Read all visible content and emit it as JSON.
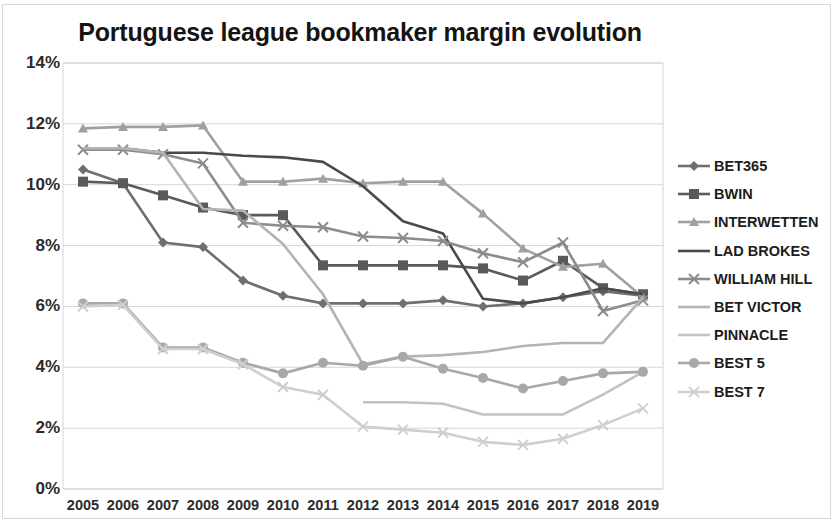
{
  "chart_title": "Portuguese league bookmaker margin evolution",
  "axes": {
    "y_ticks": [
      "0%",
      "2%",
      "4%",
      "6%",
      "8%",
      "10%",
      "12%",
      "14%"
    ],
    "x_ticks": [
      "2005",
      "2006",
      "2007",
      "2008",
      "2009",
      "2010",
      "2011",
      "2012",
      "2013",
      "2014",
      "2015",
      "2016",
      "2017",
      "2018",
      "2019"
    ]
  },
  "legend": {
    "items": [
      {
        "label": "BET365",
        "marker": "diamond",
        "color": "#6f6f6f"
      },
      {
        "label": "BWIN",
        "marker": "square",
        "color": "#5a5a5a"
      },
      {
        "label": "INTERWETTEN",
        "marker": "triangle",
        "color": "#a0a0a0"
      },
      {
        "label": "LAD BROKES",
        "marker": "none",
        "color": "#4a4a4a"
      },
      {
        "label": "WILLIAM HILL",
        "marker": "cross",
        "color": "#8c8c8c"
      },
      {
        "label": "BET VICTOR",
        "marker": "none",
        "color": "#b4b4b4"
      },
      {
        "label": "PINNACLE",
        "marker": "none",
        "color": "#c2c2c2"
      },
      {
        "label": "BEST 5",
        "marker": "circle",
        "color": "#a8a8a8"
      },
      {
        "label": "BEST 7",
        "marker": "cross",
        "color": "#cfcfcf"
      }
    ]
  },
  "chart_data": {
    "type": "line",
    "title": "Portuguese league bookmaker margin evolution",
    "xlabel": "",
    "ylabel": "",
    "ylim": [
      0,
      14
    ],
    "y_unit": "%",
    "grid": true,
    "legend_position": "right",
    "categories": [
      "2005",
      "2006",
      "2007",
      "2008",
      "2009",
      "2010",
      "2011",
      "2012",
      "2013",
      "2014",
      "2015",
      "2016",
      "2017",
      "2018",
      "2019"
    ],
    "series": [
      {
        "name": "BET365",
        "marker": "diamond",
        "color": "#6f6f6f",
        "values": [
          10.5,
          10.05,
          8.1,
          7.95,
          6.85,
          6.35,
          6.1,
          6.1,
          6.1,
          6.2,
          6.0,
          6.1,
          6.3,
          6.5,
          6.35
        ]
      },
      {
        "name": "BWIN",
        "marker": "square",
        "color": "#5a5a5a",
        "values": [
          10.1,
          10.05,
          9.65,
          9.25,
          9.0,
          9.0,
          7.35,
          7.35,
          7.35,
          7.35,
          7.25,
          6.85,
          7.5,
          6.6,
          6.4
        ]
      },
      {
        "name": "INTERWETTEN",
        "marker": "triangle",
        "color": "#a0a0a0",
        "values": [
          11.85,
          11.9,
          11.9,
          11.95,
          10.1,
          10.1,
          10.2,
          10.05,
          10.1,
          10.1,
          9.05,
          7.9,
          7.3,
          7.4,
          6.3
        ]
      },
      {
        "name": "LAD BROKES",
        "marker": "none",
        "color": "#4a4a4a",
        "values": [
          11.2,
          11.2,
          11.05,
          11.05,
          10.95,
          10.9,
          10.75,
          9.95,
          8.8,
          8.4,
          6.25,
          6.1,
          6.3,
          6.6,
          6.4
        ]
      },
      {
        "name": "WILLIAM HILL",
        "marker": "cross",
        "color": "#8c8c8c",
        "values": [
          11.15,
          11.15,
          11.0,
          10.7,
          8.75,
          8.65,
          8.6,
          8.3,
          8.25,
          8.15,
          7.75,
          7.45,
          8.1,
          5.85,
          6.2
        ]
      },
      {
        "name": "BET VICTOR",
        "marker": "none",
        "color": "#b4b4b4",
        "values": [
          11.2,
          11.2,
          11.05,
          9.2,
          9.15,
          8.05,
          6.4,
          4.1,
          4.35,
          4.4,
          4.5,
          4.7,
          4.8,
          4.8,
          6.3
        ]
      },
      {
        "name": "PINNACLE",
        "marker": "none",
        "color": "#c2c2c2",
        "values": [
          null,
          null,
          null,
          null,
          null,
          null,
          null,
          2.85,
          2.85,
          2.8,
          2.45,
          2.45,
          2.45,
          3.1,
          3.85
        ]
      },
      {
        "name": "BEST 5",
        "marker": "circle",
        "color": "#a8a8a8",
        "values": [
          6.1,
          6.1,
          4.65,
          4.65,
          4.15,
          3.8,
          4.15,
          4.05,
          4.35,
          3.95,
          3.65,
          3.3,
          3.55,
          3.8,
          3.85
        ]
      },
      {
        "name": "BEST 7",
        "marker": "cross",
        "color": "#cfcfcf",
        "values": [
          6.0,
          6.05,
          4.6,
          4.6,
          4.1,
          3.35,
          3.1,
          2.05,
          1.95,
          1.85,
          1.55,
          1.45,
          1.65,
          2.1,
          2.65
        ]
      }
    ]
  }
}
